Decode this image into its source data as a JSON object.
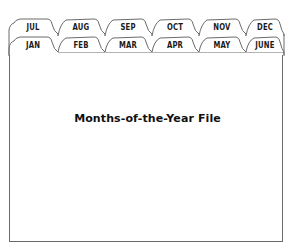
{
  "title": "Months-of-the-Year File",
  "tabs": {
    "back_row": [
      "JUL",
      "AUG",
      "SEP",
      "OCT",
      "NOV",
      "DEC"
    ],
    "front_row": [
      "JAN",
      "FEB",
      "MAR",
      "APR",
      "MAY",
      "JUNE"
    ]
  },
  "colors": {
    "outline": "#6b6b6b",
    "text": "#1a1a1a",
    "background": "#ffffff"
  }
}
